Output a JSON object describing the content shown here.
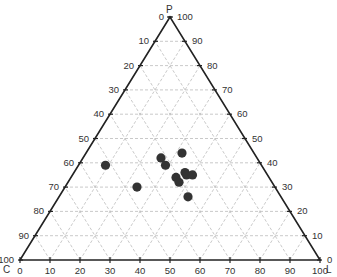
{
  "chart_data": {
    "type": "scatter",
    "subtype": "ternary",
    "title": "",
    "axes": {
      "top": {
        "name": "P",
        "label_side": "right",
        "ticks": [
          0,
          10,
          20,
          30,
          40,
          50,
          60,
          70,
          80,
          90,
          100
        ]
      },
      "left": {
        "name": "C",
        "label_side": "left",
        "ticks": [
          0,
          10,
          20,
          30,
          40,
          50,
          60,
          70,
          80,
          90,
          100
        ]
      },
      "right": {
        "name": "L",
        "label_side": "bottom",
        "ticks": [
          0,
          10,
          20,
          30,
          40,
          50,
          60,
          70,
          80,
          90,
          100
        ]
      }
    },
    "vertex_labels": {
      "top": "P",
      "bottom_left": "C",
      "bottom_right": "L"
    },
    "grid": true,
    "grid_step": 10,
    "points": [
      {
        "P": 39,
        "L": 9,
        "C": 52
      },
      {
        "P": 30,
        "L": 24,
        "C": 46
      },
      {
        "P": 42,
        "L": 26,
        "C": 32
      },
      {
        "P": 39,
        "L": 29,
        "C": 32
      },
      {
        "P": 44,
        "L": 32,
        "C": 24
      },
      {
        "P": 34,
        "L": 35,
        "C": 31
      },
      {
        "P": 32,
        "L": 37,
        "C": 31
      },
      {
        "P": 36,
        "L": 37,
        "C": 27
      },
      {
        "P": 35,
        "L": 38,
        "C": 27
      },
      {
        "P": 35,
        "L": 40,
        "C": 25
      },
      {
        "P": 26,
        "L": 43,
        "C": 31
      }
    ],
    "colors": {
      "points": "#333333",
      "frame": "#222222",
      "grid": "#bbbbbb",
      "text": "#333333"
    }
  }
}
